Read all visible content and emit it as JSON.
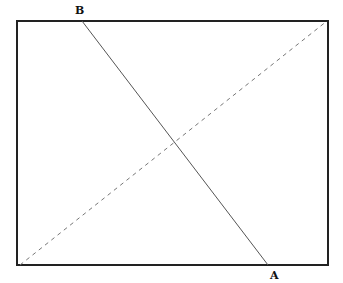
{
  "diagram": {
    "type": "geometry",
    "rectangle": {
      "x": 17,
      "y": 21,
      "width": 311,
      "height": 244,
      "stroke": "#222222"
    },
    "labels": {
      "top_point": "B",
      "bottom_point": "A"
    },
    "segments": [
      {
        "name": "BA",
        "style": "solid",
        "from": [
          82,
          21
        ],
        "to": [
          268,
          265
        ],
        "color": "#555555"
      },
      {
        "name": "diagonal",
        "style": "dashed",
        "from": [
          20,
          265
        ],
        "to": [
          327,
          21
        ],
        "color": "#777777"
      }
    ]
  }
}
